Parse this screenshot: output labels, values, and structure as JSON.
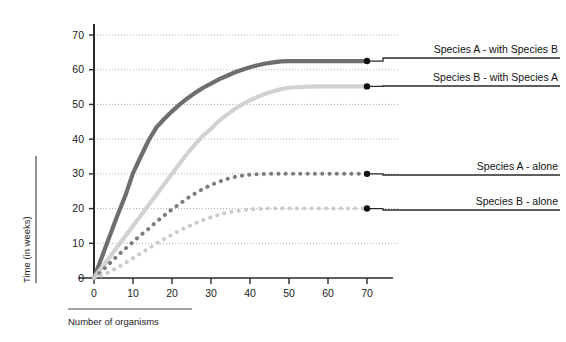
{
  "chart_data": {
    "type": "line",
    "title": "",
    "xlabel": "Number of organisms",
    "ylabel": "Time (in weeks)",
    "xlim": [
      0,
      75
    ],
    "ylim": [
      0,
      75
    ],
    "xticks": [
      0,
      10,
      20,
      30,
      40,
      50,
      60,
      70
    ],
    "yticks": [
      0,
      10,
      20,
      30,
      40,
      50,
      60,
      70
    ],
    "xtick_labels": [
      "0",
      "10",
      "20",
      "30",
      "40",
      "50",
      "60",
      "70"
    ],
    "ytick_labels": [
      "0",
      "10",
      "20",
      "30",
      "40",
      "50",
      "60",
      "70"
    ],
    "grid": true,
    "grid_style": "dotted-horizontal",
    "legend_position": "right-inline-leader",
    "x": [
      0,
      2,
      4,
      6,
      8,
      10,
      12,
      14,
      16,
      18,
      20,
      22,
      24,
      26,
      28,
      30,
      32,
      34,
      36,
      38,
      40,
      42,
      44,
      46,
      48,
      50,
      55,
      60,
      65,
      70
    ],
    "series": [
      {
        "name": "Species A - with Species B",
        "label": "Species A - with Species B",
        "style": "solid",
        "color": "#6e6e6e",
        "width": 4.2,
        "plateau": 62.5,
        "values": [
          0,
          6.0,
          12.0,
          18.0,
          23.6,
          30.2,
          35.0,
          39.6,
          43.4,
          45.8,
          48.0,
          50.0,
          51.8,
          53.4,
          54.8,
          56.0,
          57.2,
          58.2,
          59.2,
          60.0,
          60.7,
          61.3,
          61.8,
          62.1,
          62.4,
          62.5,
          62.5,
          62.5,
          62.5,
          62.5
        ]
      },
      {
        "name": "Species B - with Species A",
        "label": "Species B - with Species A",
        "style": "solid",
        "color": "#d2d2d2",
        "width": 4.2,
        "plateau": 55.2,
        "values": [
          0,
          3.0,
          6.0,
          9.0,
          12.0,
          15.0,
          18.0,
          21.0,
          24.0,
          27.0,
          30.0,
          33.0,
          36.0,
          38.6,
          41.0,
          43.0,
          45.2,
          47.0,
          48.6,
          50.0,
          51.2,
          52.2,
          53.1,
          53.8,
          54.4,
          54.8,
          55.1,
          55.2,
          55.2,
          55.2
        ]
      },
      {
        "name": "Species A - alone",
        "label": "Species A - alone",
        "style": "dotted",
        "color": "#7d7d7d",
        "width": 4.0,
        "plateau": 30.0,
        "values": [
          0,
          2.0,
          4.2,
          6.4,
          8.4,
          10.4,
          12.4,
          14.2,
          16.2,
          18.0,
          19.8,
          21.4,
          23.0,
          24.4,
          25.7,
          26.8,
          27.7,
          28.5,
          29.1,
          29.5,
          29.8,
          29.9,
          30.0,
          30.0,
          30.0,
          30.0,
          30.0,
          30.0,
          30.0,
          30.0
        ]
      },
      {
        "name": "Species B - alone",
        "label": "Species B - alone",
        "style": "dotted",
        "color": "#cbcbcb",
        "width": 4.0,
        "plateau": 20.0,
        "values": [
          0,
          0.8,
          1.8,
          3.0,
          4.3,
          5.7,
          7.1,
          8.5,
          9.9,
          11.2,
          12.5,
          13.7,
          14.8,
          15.8,
          16.7,
          17.5,
          18.2,
          18.8,
          19.2,
          19.5,
          19.8,
          19.9,
          20.0,
          20.0,
          20.0,
          20.0,
          20.0,
          20.0,
          20.0,
          20.0
        ]
      }
    ],
    "endpoint_marker": {
      "x": 70,
      "color": "#111111",
      "radius": 3.2
    },
    "leader_line_color": "#2a2a2a",
    "annotations": []
  }
}
